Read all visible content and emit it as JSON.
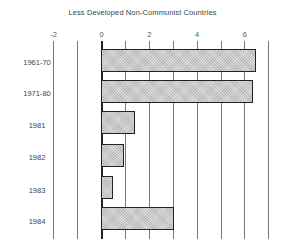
{
  "chart_data": {
    "type": "bar",
    "orientation": "horizontal",
    "title": "Less Developed Non-Communist Countries",
    "xlabel": "",
    "ylabel": "",
    "categories": [
      "1961-70",
      "1971-80",
      "1981",
      "1982",
      "1983",
      "1984"
    ],
    "values": [
      6.45,
      6.3,
      1.4,
      0.9,
      0.45,
      3.0
    ],
    "xlim": [
      -2,
      7
    ],
    "x_ticks": [
      -2,
      0,
      2,
      4,
      6
    ],
    "x_tick_labels": [
      "-2",
      "0",
      "2",
      "4",
      "6"
    ],
    "gridlines": [
      -2,
      -1,
      0,
      1,
      2,
      3,
      4,
      5,
      6,
      7
    ],
    "grid": true,
    "legend": null,
    "bar_fill": "#dedede",
    "bar_pattern": "crosshatch",
    "bar_border": "#222222"
  },
  "layout": {
    "zero_x": 101,
    "px_per_unit": 23.9,
    "bar_tops": [
      49,
      80,
      111,
      144,
      176,
      207
    ],
    "label_tops": [
      58,
      89,
      121,
      153,
      186,
      217
    ]
  }
}
